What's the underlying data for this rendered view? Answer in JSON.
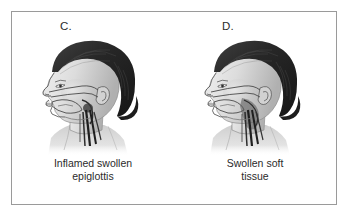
{
  "figure": {
    "type": "medical-illustration",
    "frame_color": "#9a9a9a",
    "background_color": "#ffffff"
  },
  "colors": {
    "hair": "#2a2a2a",
    "hair_highlight": "#6d6d6d",
    "skin": "#dcdcdc",
    "skin_shadow": "#b4b4b4",
    "outline": "#4a4a4a",
    "airway_dark": "#1f1f1f",
    "text": "#2b2b2b",
    "frame": "#9a9a9a"
  },
  "panels": [
    {
      "letter": "C.",
      "caption_line1": "Inflamed swollen",
      "caption_line2": "epiglottis",
      "subject": "child head lateral profile facing left with dark bobbed hair"
    },
    {
      "letter": "D.",
      "caption_line1": "Swollen soft",
      "caption_line2": "tissue",
      "subject": "child head lateral profile facing left with dark bobbed hair"
    }
  ]
}
